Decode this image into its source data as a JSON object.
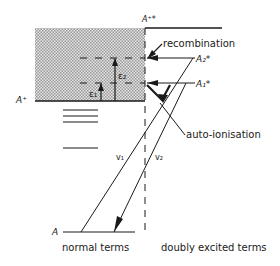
{
  "diagram": {
    "levels": {
      "ion_excited": "A⁺*",
      "ion": "A⁺",
      "a2": "A₂*",
      "a1": "A₁*",
      "ground": "A"
    },
    "energies": {
      "e1": "ε₁",
      "e2": "ε₂"
    },
    "transitions": {
      "v1": "v₁",
      "v2": "v₂"
    },
    "annotations": {
      "recombination": "recombination",
      "autoionisation": "auto-ionisation"
    },
    "columns": {
      "left": "normal terms",
      "right": "doubly excited terms"
    },
    "colors": {
      "line": "#1a1a1a",
      "shade": "#c8c8c8"
    }
  }
}
